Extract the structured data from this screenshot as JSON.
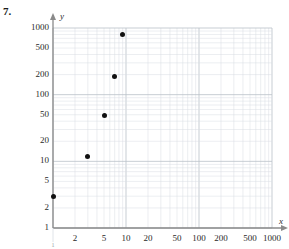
{
  "problem": {
    "number": "7."
  },
  "axes": {
    "x_label": "x",
    "y_label": "y",
    "x_ticks": [
      "2",
      "5",
      "10",
      "20",
      "50",
      "100",
      "200",
      "500",
      "1000"
    ],
    "y_ticks": [
      "1000",
      "500",
      "200",
      "100",
      "50",
      "20",
      "10",
      "5",
      "2",
      "1"
    ],
    "x_origin_label": "1"
  },
  "colors": {
    "grid_minor": "#d8dde3",
    "grid_major": "#b9c0c8",
    "axis": "#8a8a8a",
    "point": "#111111",
    "text": "#2a2a2a"
  },
  "chart_data": {
    "type": "scatter",
    "title": "",
    "xlabel": "x",
    "ylabel": "y",
    "xscale": "log",
    "yscale": "log",
    "xlim": [
      1,
      1000
    ],
    "ylim": [
      1,
      1000
    ],
    "grid": true,
    "legend": null,
    "xticks": [
      2,
      5,
      10,
      20,
      50,
      100,
      200,
      500,
      1000
    ],
    "yticks": [
      1,
      2,
      5,
      10,
      20,
      50,
      100,
      200,
      500,
      1000
    ],
    "points": [
      {
        "x": 1,
        "y": 3
      },
      {
        "x": 3,
        "y": 12
      },
      {
        "x": 5,
        "y": 48
      },
      {
        "x": 7,
        "y": 190
      },
      {
        "x": 9,
        "y": 800
      }
    ]
  }
}
